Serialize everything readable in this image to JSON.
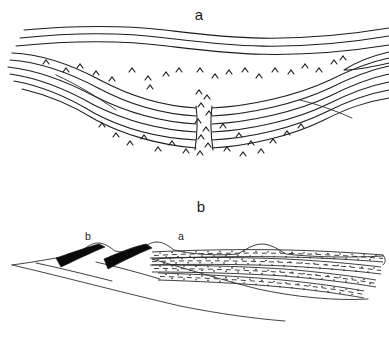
{
  "figure": {
    "kind": "geological-cross-section",
    "background_color": "#ffffff",
    "ink_color": "#1c1c1c",
    "width": 389,
    "height": 339,
    "panels": [
      {
        "id": "panel-a",
        "label": "a",
        "label_x": 199,
        "label_y": 20,
        "description": "Synformal basin fold of layered strata cut by a central vertical fault gap, with caret basement ornament"
      },
      {
        "id": "panel-b",
        "label": "b",
        "label_x": 201,
        "label_y": 212,
        "description": "Thrust wedge with two black thrust slices and a stippled sedimentary package above a basal detachment"
      }
    ]
  },
  "panel_a": {
    "label": "a",
    "fault_gap": {
      "name": "central-fault-gap",
      "left_edge_x": 196,
      "right_edge_x": 211,
      "top_y": 90,
      "bottom_y": 150
    },
    "layer_count_left": 9,
    "layer_count_right": 8,
    "chevron_count": 46,
    "chevron_symbol": "^",
    "chevron_meaning": "crystalline-basement-ornament",
    "upper_layers": [
      "M 24,30 C 70,26 120,25 165,30 C 215,36 280,46 389,28",
      "M 20,38 C 68,33 120,32 166,38 C 216,44 282,54 389,36",
      "M 16,46 C 66,41 120,40 167,46 C 217,52 283,62 389,45"
    ],
    "fold_layers_left": [
      "M 12,53 C 40,54 70,64 100,80 C 130,96 160,106 196,108",
      "M 10,60 C 38,62 68,72 98,88 C 128,104 160,114 196,116",
      "M 8,66 C 36,69 66,80 96,96 C 126,112 160,122 196,124",
      "M 10,73 C 38,77 66,88 94,104 C 124,120 158,130 196,132",
      "M 14,80 C 42,85 68,96 94,112 C 122,128 156,138 196,140",
      "M 22,88 C 48,94 72,104 96,120 C 122,134 158,145 196,148"
    ],
    "fold_layers_right": [
      "M 211,108 C 250,106 296,96 330,80 C 352,69 370,62 389,58",
      "M 211,116 C 250,114 296,104 330,88 C 352,77 370,70 389,66",
      "M 211,124 C 250,122 296,112 330,96 C 352,85 370,78 389,74",
      "M 211,132 C 250,130 296,120 328,104 C 350,93 368,86 389,82",
      "M 211,140 C 250,138 294,128 326,112 C 348,101 366,94 389,90",
      "M 211,148 C 248,146 292,136 324,120 C 346,109 364,102 389,98"
    ],
    "wedge_tip": {
      "name": "right-wedge-tip",
      "path": "M 389,52 C 372,56 356,62 344,70 C 356,70 372,67 389,63"
    },
    "chevrons": [
      [
        46,
        62
      ],
      [
        66,
        70
      ],
      [
        80,
        66
      ],
      [
        96,
        72
      ],
      [
        112,
        78
      ],
      [
        132,
        70
      ],
      [
        148,
        78
      ],
      [
        150,
        86
      ],
      [
        166,
        74
      ],
      [
        178,
        70
      ],
      [
        200,
        70
      ],
      [
        214,
        76
      ],
      [
        228,
        72
      ],
      [
        244,
        70
      ],
      [
        258,
        76
      ],
      [
        274,
        70
      ],
      [
        290,
        72
      ],
      [
        304,
        66
      ],
      [
        318,
        70
      ],
      [
        334,
        62
      ],
      [
        342,
        58
      ],
      [
        198,
        92
      ],
      [
        206,
        96
      ],
      [
        200,
        104
      ],
      [
        208,
        112
      ],
      [
        196,
        120
      ],
      [
        204,
        128
      ],
      [
        200,
        136
      ],
      [
        206,
        144
      ],
      [
        198,
        152
      ],
      [
        102,
        124
      ],
      [
        116,
        134
      ],
      [
        130,
        142
      ],
      [
        144,
        136
      ],
      [
        158,
        148
      ],
      [
        172,
        142
      ],
      [
        186,
        150
      ],
      [
        222,
        126
      ],
      [
        238,
        134
      ],
      [
        250,
        142
      ],
      [
        226,
        148
      ],
      [
        242,
        152
      ],
      [
        260,
        150
      ],
      [
        272,
        140
      ],
      [
        286,
        132
      ],
      [
        300,
        126
      ]
    ]
  },
  "panel_b": {
    "label": "b",
    "inner_labels": [
      {
        "text": "b",
        "x": 88,
        "y": 240,
        "name": "thrust-slice-label-b"
      },
      {
        "text": "a",
        "x": 181,
        "y": 240,
        "name": "sediment-package-label-a"
      }
    ],
    "surface_line": "M 12, 265 C 38,262 56,259 70,256 C 80,254 86,252 92,251 C 96,247 102,243 108,243 C 114,243 120,247 124,251 C 132,253 140,252 146,250 C 150,246 156,242 162,242 C 168,242 174,246 178,250 C 192,254 214,256 238,254 C 248,249 256,244 264,244 C 272,244 280,249 288,254 C 310,257 350,258 383,257",
    "basal_detachment": "M 12,265 C 60,276 120,292 180,306 C 220,314 258,319 285,321",
    "thrust_slices": [
      {
        "name": "thrust-slice-1",
        "path": "M 62,258 L 104,245 L 112,247 L 74,268 Z",
        "fill": "#0a0a0a"
      },
      {
        "name": "thrust-slice-2",
        "path": "M 104,270 L 118,246 L 126,248 L 114,272 Z",
        "fill": "#0a0a0a"
      }
    ],
    "thrust_slice_shapes": [
      "M 58,256 C 72,252 90,246 105,243 L 110,246 C 94,252 76,260 62,266 Z",
      "M 104,258 C 118,252 134,246 148,243 L 153,247 C 138,253 122,262 108,268 Z"
    ],
    "thrust_fault_lines": [
      "M 56,257 C 74,262 96,268 116,273",
      "M 104,259 C 122,264 142,270 160,275"
    ],
    "sediment_bands": [
      {
        "name": "sediment-band-1",
        "top": "M 152,252 C 190,250 240,249 288,250 C 326,251 358,253 383,255",
        "bottom": "M 152,259 C 190,257 240,256 288,257 C 326,258 358,260 383,262"
      },
      {
        "name": "sediment-band-2",
        "top": "M 150,258 C 188,257 238,257 286,259 C 324,261 356,264 381,267",
        "bottom": "M 150,265 C 188,264 238,264 286,266 C 324,268 356,271 381,274"
      },
      {
        "name": "sediment-band-3",
        "top": "M 152,265 C 188,265 236,266 284,269 C 320,272 352,276 376,280",
        "bottom": "M 152,272 C 188,272 236,273 284,276 C 320,279 352,283 376,287"
      },
      {
        "name": "sediment-band-4",
        "top": "M 158,273 C 192,274 238,276 282,280 C 314,283 342,287 364,291",
        "bottom": "M 158,280 C 192,281 238,283 282,287 C 314,290 342,294 364,298"
      }
    ],
    "sediment_pattern": {
      "name": "stipple-and-dash",
      "dash_pattern": "5 4",
      "dot_radius": 0.75,
      "meaning": "imbricated-sediment-ornament"
    },
    "right_boundary": "M 383,255 C 385,258 386,262 383,266"
  }
}
